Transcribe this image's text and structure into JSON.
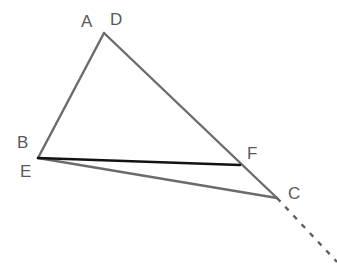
{
  "figure": {
    "canvas": {
      "width": 337,
      "height": 268,
      "background": "#ffffff"
    },
    "colors": {
      "triangle_stroke": "#6b6b6b",
      "segment_ef_stroke": "#111111",
      "dashed_ray_stroke": "#5e5e63",
      "label_color": "#59595c"
    },
    "strokes": {
      "triangle_width": 2.4,
      "segment_ef_width": 2.6,
      "dashed_ray_width": 2.4,
      "dash_pattern": "5 7"
    },
    "points": [
      {
        "id": "A",
        "label": "A",
        "x": 104,
        "y": 33,
        "label_x": 81,
        "label_y": 13
      },
      {
        "id": "D",
        "label": "D",
        "x": 104,
        "y": 33,
        "label_x": 110,
        "label_y": 11
      },
      {
        "id": "B",
        "label": "B",
        "x": 38,
        "y": 158,
        "label_x": 17,
        "label_y": 134
      },
      {
        "id": "E",
        "label": "E",
        "x": 38,
        "y": 158,
        "label_x": 20,
        "label_y": 163
      },
      {
        "id": "F",
        "label": "F",
        "x": 240,
        "y": 165,
        "label_x": 247,
        "label_y": 145
      },
      {
        "id": "C",
        "label": "C",
        "x": 277,
        "y": 198,
        "label_x": 288,
        "label_y": 185
      }
    ],
    "edges": [
      {
        "id": "AB",
        "from": "A",
        "to": "B",
        "style": "solid",
        "color": "triangle_stroke"
      },
      {
        "id": "AC",
        "from": "A",
        "to": "C",
        "style": "solid",
        "color": "triangle_stroke"
      },
      {
        "id": "BC",
        "from": "B",
        "to": "C",
        "style": "solid",
        "color": "triangle_stroke"
      },
      {
        "id": "EF",
        "from": "E",
        "to": "F",
        "style": "solid",
        "color": "segment_ef_stroke"
      }
    ],
    "rays": [
      {
        "id": "ray-beyond-C",
        "from_x": 277,
        "from_y": 198,
        "to_x": 337,
        "to_y": 262,
        "style": "dashed"
      }
    ]
  }
}
